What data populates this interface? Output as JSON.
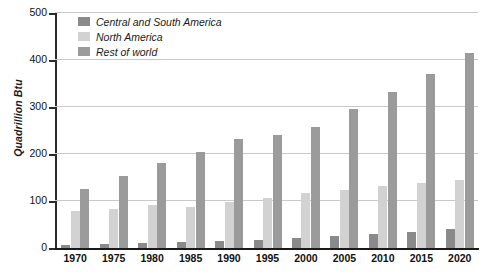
{
  "chart_data": {
    "type": "bar",
    "title": "",
    "xlabel": "",
    "ylabel": "Quadrillion Btu",
    "ylim": [
      0,
      500
    ],
    "yticks": [
      0,
      100,
      200,
      300,
      400,
      500
    ],
    "grid": true,
    "legend_position": "top-left",
    "categories": [
      "1970",
      "1975",
      "1980",
      "1985",
      "1990",
      "1995",
      "2000",
      "2005",
      "2010",
      "2015",
      "2020"
    ],
    "series": [
      {
        "name": "Central and South America",
        "color": "#8a8a8a",
        "values": [
          7,
          8,
          11,
          12,
          14,
          17,
          21,
          25,
          30,
          35,
          40
        ]
      },
      {
        "name": "North America",
        "color": "#d2d2d2",
        "values": [
          78,
          83,
          91,
          88,
          98,
          106,
          118,
          123,
          131,
          138,
          145
        ]
      },
      {
        "name": "Rest of world",
        "color": "#9b9b9b",
        "values": [
          125,
          154,
          181,
          205,
          231,
          240,
          258,
          296,
          333,
          370,
          415
        ]
      }
    ]
  },
  "axis": {
    "y_title": "Quadrillion Btu",
    "y_tick_labels": [
      "500",
      "400",
      "300",
      "200",
      "100",
      "0"
    ],
    "x_tick_labels": [
      "1970",
      "1975",
      "1980",
      "1985",
      "1990",
      "1995",
      "2000",
      "2005",
      "2010",
      "2015",
      "2020"
    ]
  },
  "legend": {
    "items": [
      {
        "label": "Central and South America",
        "color": "#8a8a8a"
      },
      {
        "label": "North America",
        "color": "#d2d2d2"
      },
      {
        "label": "Rest of world",
        "color": "#9b9b9b"
      }
    ]
  }
}
